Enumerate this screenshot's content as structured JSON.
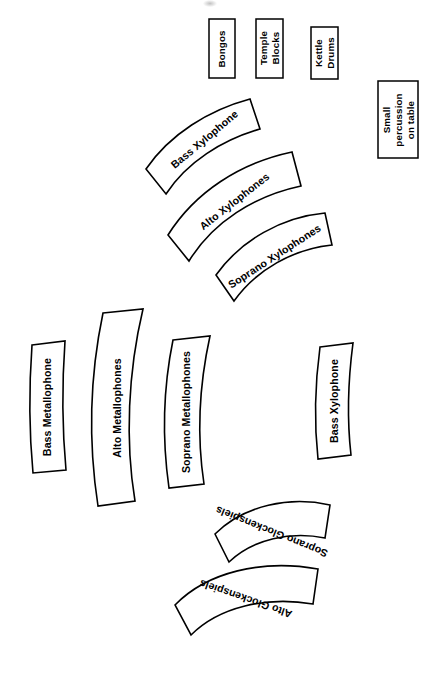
{
  "diagram": {
    "orientation": "rotated-90",
    "background_color": "#ffffff",
    "stroke_color": "#000000",
    "fill_color": "#ffffff",
    "percussion_boxes": [
      {
        "id": "bongos",
        "label": "Bongos",
        "lines": [
          "Bongos"
        ]
      },
      {
        "id": "temple-blocks",
        "label": "Temple Blocks",
        "lines": [
          "Temple",
          "Blocks"
        ]
      },
      {
        "id": "kettle-drums",
        "label": "Kettle Drums",
        "lines": [
          "Kettle",
          "Drums"
        ]
      },
      {
        "id": "small-percussion",
        "label": "Small percussion on table",
        "lines": [
          "Small",
          "percussion",
          "on table"
        ]
      }
    ],
    "instrument_bars": [
      {
        "id": "bass-xylophone-left",
        "label": "Bass Xylophone"
      },
      {
        "id": "alto-xylophones",
        "label": "Alto Xylophones"
      },
      {
        "id": "soprano-xylophones",
        "label": "Soprano Xylophones"
      },
      {
        "id": "bass-metallophone",
        "label": "Bass Metallophone"
      },
      {
        "id": "alto-metallophones",
        "label": "Alto Metallophones"
      },
      {
        "id": "soprano-metallophones",
        "label": "Soprano Metallophones"
      },
      {
        "id": "bass-xylophone-right",
        "label": "Bass Xylophone"
      },
      {
        "id": "soprano-glockenspiels",
        "label": "Soprano Glockenspiels"
      },
      {
        "id": "alto-glockenspiels",
        "label": "Alto Glockenspiels"
      }
    ]
  }
}
